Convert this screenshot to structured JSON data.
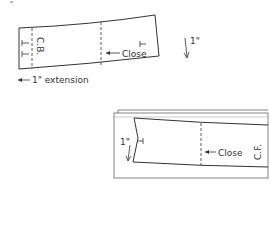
{
  "diagram_1": {
    "labels": {
      "center_back": "C.B.",
      "close": "Close",
      "one_inch": "1\"",
      "extension": "1\" extension"
    }
  },
  "diagram_2": {
    "labels": {
      "center_front": "C.F.",
      "close": "Close",
      "one_inch": "1\""
    }
  },
  "colors": {
    "line": "#333333",
    "text": "#333333",
    "frame": "#666666"
  }
}
